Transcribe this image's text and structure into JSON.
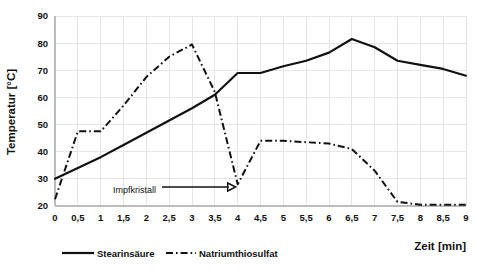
{
  "chart_data": {
    "type": "line",
    "title": "",
    "xlabel": "Zeit [min]",
    "ylabel": "Temperatur [°C]",
    "xlim": [
      0,
      9
    ],
    "ylim": [
      20,
      90
    ],
    "grid": true,
    "legend_position": "bottom-left",
    "x": [
      0,
      0.5,
      1,
      1.5,
      2,
      2.5,
      3,
      3.5,
      4,
      4.5,
      5,
      5.5,
      6,
      6.5,
      7,
      7.5,
      8,
      8.5,
      9
    ],
    "xtick_labels": [
      "0",
      "0,5",
      "1",
      "1,5",
      "2",
      "2,5",
      "3",
      "3,5",
      "4",
      "4,5",
      "5",
      "5,5",
      "6",
      "6,5",
      "7",
      "7,5",
      "8",
      "8,5",
      "9"
    ],
    "ytick_labels": [
      "20",
      "30",
      "40",
      "50",
      "60",
      "70",
      "80",
      "90"
    ],
    "ytick_values": [
      20,
      30,
      40,
      50,
      60,
      70,
      80,
      90
    ],
    "series": [
      {
        "name": "Stearinsäure",
        "style": "solid",
        "color": "#111111",
        "values": [
          30,
          34,
          38,
          42.5,
          47,
          51.5,
          56,
          61,
          69,
          69,
          71.5,
          73.5,
          76.5,
          81.5,
          78.5,
          73.5,
          72,
          70.5,
          68
        ]
      },
      {
        "name": "Natriumthiosulfat",
        "style": "dashdot",
        "color": "#111111",
        "values": [
          22.5,
          47.5,
          47.5,
          57,
          67.5,
          75,
          79.5,
          62,
          28,
          44,
          44,
          43.5,
          43,
          41,
          33,
          21.5,
          20.5,
          20.5,
          20.5
        ]
      }
    ],
    "annotations": [
      {
        "text": "Impfkristall",
        "x": 4,
        "y": 27,
        "label_x": 3.0,
        "label_y": 26
      }
    ]
  },
  "legend": {
    "items": [
      {
        "label": "Stearinsäure",
        "style": "solid"
      },
      {
        "label": "Natriumthiosulfat",
        "style": "dashdot"
      }
    ]
  }
}
